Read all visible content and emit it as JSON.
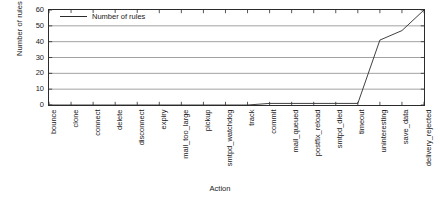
{
  "chart_data": {
    "type": "line",
    "title": "",
    "xlabel": "Action",
    "ylabel": "Number of rules",
    "legend": [
      "Number of rules"
    ],
    "legend_position": "top-left-inside",
    "grid": true,
    "grid_axis": "y",
    "ylim": [
      0,
      60
    ],
    "yticks": [
      0,
      10,
      20,
      30,
      40,
      50,
      60
    ],
    "ytick_labels": [
      "0",
      "10",
      "20",
      "30",
      "40",
      "50",
      "60"
    ],
    "categories": [
      "bounce",
      "clone",
      "connect",
      "delete",
      "disconnect",
      "expiry",
      "mail_too_large",
      "pickup",
      "smtpd_watchdog",
      "track",
      "commit",
      "mail_queued",
      "postfix_reload",
      "smtpd_died",
      "timeout",
      "uninteresting",
      "save_data",
      "delivery_rejected"
    ],
    "series": [
      {
        "name": "Number of rules",
        "color": "#2b2b2b",
        "values": [
          0,
          0,
          0,
          0,
          0,
          0,
          0,
          0,
          0,
          0,
          1,
          1,
          1,
          1,
          1,
          41,
          47,
          60
        ]
      }
    ]
  },
  "axis_colors": {
    "frame": "#2b2b2b",
    "grid": "#7a7a7a",
    "line": "#2b2b2b",
    "background": "#ffffff"
  }
}
